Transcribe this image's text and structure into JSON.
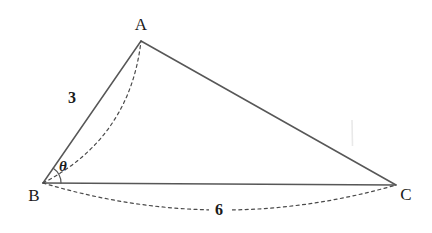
{
  "figure": {
    "type": "geometry-diagram",
    "shape": "triangle",
    "background_color": "#ffffff",
    "stroke_color": "#575757",
    "dash_color": "#4a4a4a",
    "text_color": "#1a1a1a",
    "width": 432,
    "height": 233
  },
  "vertices": {
    "a": {
      "label": "A",
      "x": 141,
      "y": 41,
      "label_x": 141,
      "label_y": 26
    },
    "b": {
      "label": "B",
      "x": 43,
      "y": 183,
      "label_x": 34,
      "label_y": 197
    },
    "c": {
      "label": "C",
      "x": 396,
      "y": 185,
      "label_x": 406,
      "label_y": 196
    }
  },
  "sides": [
    {
      "name": "side-ab",
      "from": "B",
      "to": "A",
      "measure": "3",
      "measure_x": 72,
      "measure_y": 99
    },
    {
      "name": "side-ac",
      "from": "A",
      "to": "C",
      "measure": "",
      "measure_x": 0,
      "measure_y": 0
    },
    {
      "name": "side-bc",
      "from": "B",
      "to": "C",
      "measure": "6",
      "measure_x": 219,
      "measure_y": 211
    }
  ],
  "angles": [
    {
      "name": "angle-b",
      "label": "θ",
      "vertex": "B",
      "label_x": 63,
      "label_y": 168,
      "arc_radius": 18
    }
  ],
  "measures": {
    "side_ab_length": "3",
    "side_bc_length": "6",
    "angle_at_b": "θ"
  },
  "chart_data": {
    "type": "diagram",
    "title": "",
    "labels": [
      "A",
      "B",
      "C",
      "3",
      "6",
      "θ"
    ],
    "points": [
      {
        "name": "A",
        "x": 141,
        "y": 41
      },
      {
        "name": "B",
        "x": 43,
        "y": 183
      },
      {
        "name": "C",
        "x": 396,
        "y": 185
      }
    ],
    "annotations": [
      {
        "text": "3",
        "attached_to": "BA",
        "x": 72,
        "y": 99
      },
      {
        "text": "6",
        "attached_to": "BC",
        "x": 219,
        "y": 211
      },
      {
        "text": "θ",
        "attached_to": "angle at B",
        "x": 63,
        "y": 168
      }
    ]
  }
}
